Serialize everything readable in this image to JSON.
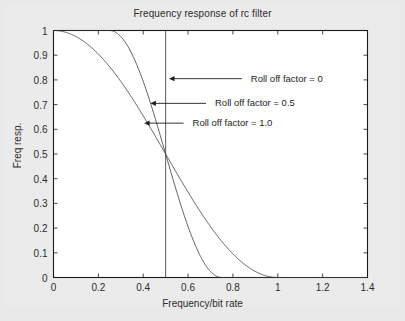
{
  "chart_data": {
    "type": "line",
    "title": "Frequency response of rc filter",
    "xlabel": "Frequency/bit rate",
    "ylabel": "Freq resp.",
    "xlim": [
      0,
      1.4
    ],
    "ylim": [
      0,
      1
    ],
    "xticks": [
      "0",
      "0.2",
      "0.4",
      "0.6",
      "0.8",
      "1",
      "1.2",
      "1.4"
    ],
    "xtick_values": [
      0,
      0.2,
      0.4,
      0.6,
      0.8,
      1.0,
      1.2,
      1.4
    ],
    "yticks": [
      "0",
      "0.1",
      "0.2",
      "0.3",
      "0.4",
      "0.5",
      "0.6",
      "0.7",
      "0.8",
      "0.9",
      "1"
    ],
    "ytick_values": [
      0,
      0.1,
      0.2,
      0.3,
      0.4,
      0.5,
      0.6,
      0.7,
      0.8,
      0.9,
      1.0
    ],
    "grid": false,
    "legend_position": "inline-annotations",
    "line_color": "#4a4a4a",
    "axis_color": "#1a1a1a",
    "series": [
      {
        "name": "Roll off factor = 0",
        "beta": 0,
        "x": [
          0,
          0.1,
          0.2,
          0.3,
          0.4,
          0.45,
          0.49,
          0.5,
          0.5,
          0.51,
          0.55,
          0.6,
          0.8,
          1.0,
          1.2,
          1.4
        ],
        "values": [
          1,
          1,
          1,
          1,
          1,
          1,
          1,
          1,
          0,
          0,
          0,
          0,
          0,
          0,
          0,
          0
        ]
      },
      {
        "name": "Roll off factor = 0.5",
        "beta": 0.5,
        "x": [
          0,
          0.05,
          0.1,
          0.15,
          0.2,
          0.25,
          0.3,
          0.35,
          0.4,
          0.45,
          0.5,
          0.55,
          0.6,
          0.65,
          0.7,
          0.75,
          0.8,
          1.0,
          1.2,
          1.4
        ],
        "values": [
          1,
          1,
          1,
          1,
          1,
          1,
          0.976,
          0.905,
          0.794,
          0.655,
          0.5,
          0.345,
          0.206,
          0.095,
          0.024,
          0,
          0,
          0,
          0,
          0
        ]
      },
      {
        "name": "Roll off factor = 1.0",
        "beta": 1.0,
        "x": [
          0,
          0.05,
          0.1,
          0.15,
          0.2,
          0.25,
          0.3,
          0.35,
          0.4,
          0.45,
          0.5,
          0.55,
          0.6,
          0.65,
          0.7,
          0.75,
          0.8,
          0.85,
          0.9,
          0.95,
          1.0,
          1.1,
          1.2,
          1.4
        ],
        "values": [
          1,
          0.994,
          0.976,
          0.946,
          0.905,
          0.854,
          0.794,
          0.728,
          0.655,
          0.579,
          0.5,
          0.421,
          0.345,
          0.272,
          0.206,
          0.146,
          0.095,
          0.054,
          0.024,
          0.006,
          0,
          0,
          0,
          0
        ]
      }
    ],
    "vertical_marker": {
      "x": 0.5,
      "from_y": 0,
      "to_y": 1
    },
    "annotations": [
      {
        "label": "Roll off factor = 0",
        "text_x": 0.88,
        "text_y": 0.805,
        "arrow_from_x": 0.84,
        "arrow_from_y": 0.805,
        "arrow_to_x": 0.515,
        "arrow_to_y": 0.805
      },
      {
        "label": "Roll off factor = 0.5",
        "text_x": 0.72,
        "text_y": 0.705,
        "arrow_from_x": 0.68,
        "arrow_from_y": 0.705,
        "arrow_to_x": 0.432,
        "arrow_to_y": 0.705
      },
      {
        "label": "Roll off factor = 1.0",
        "text_x": 0.62,
        "text_y": 0.625,
        "arrow_from_x": 0.58,
        "arrow_from_y": 0.625,
        "arrow_to_x": 0.404,
        "arrow_to_y": 0.625
      }
    ]
  }
}
